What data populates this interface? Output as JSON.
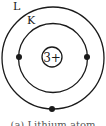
{
  "diagram": {
    "nucleus": {
      "label": "3+"
    },
    "shells": [
      {
        "label": "K",
        "electrons": 2
      },
      {
        "label": "L",
        "electrons": 1
      }
    ],
    "caption": "(a) Lithium atom",
    "colors": {
      "line": "#1a1a1a",
      "electron": "#1a1a1a",
      "background": "#ffffff"
    }
  }
}
